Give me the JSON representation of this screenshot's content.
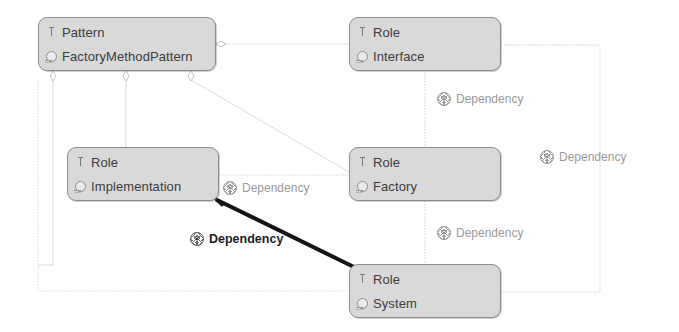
{
  "diagram": {
    "title": "FactoryMethodPattern",
    "background": "#ffffff",
    "node_fill": "#d9d9d9",
    "node_border": "#8d8d8d",
    "wire_color": "#c9c9c9",
    "selected_wire_color": "#141414",
    "label_color": "#9a9a9a",
    "selected_label_color": "#1d1d1d"
  },
  "nodes": [
    {
      "id": "pattern",
      "stereotype": "Pattern",
      "name": "FactoryMethodPattern",
      "icon_top": "stereotype-icon",
      "icon_bottom": "element-icon",
      "x": 38,
      "y": 17,
      "w": 178,
      "h": 54
    },
    {
      "id": "interface",
      "stereotype": "Role",
      "name": "Interface",
      "icon_top": "stereotype-icon",
      "icon_bottom": "element-icon",
      "x": 349,
      "y": 17,
      "w": 152,
      "h": 54
    },
    {
      "id": "implementation",
      "stereotype": "Role",
      "name": "Implementation",
      "icon_top": "stereotype-icon",
      "icon_bottom": "element-icon",
      "x": 67,
      "y": 147,
      "w": 152,
      "h": 54
    },
    {
      "id": "factory",
      "stereotype": "Role",
      "name": "Factory",
      "icon_top": "stereotype-icon",
      "icon_bottom": "element-icon",
      "x": 349,
      "y": 147,
      "w": 152,
      "h": 54
    },
    {
      "id": "system",
      "stereotype": "Role",
      "name": "System",
      "icon_top": "stereotype-icon",
      "icon_bottom": "element-icon",
      "x": 349,
      "y": 264,
      "w": 152,
      "h": 54
    }
  ],
  "edge_labels": [
    {
      "id": "dep-interface-factory",
      "text": "Dependency",
      "icon": "dependency-icon",
      "x": 437,
      "y": 92,
      "selected": false
    },
    {
      "id": "dep-interface-system",
      "text": "Dependency",
      "icon": "dependency-icon",
      "x": 540,
      "y": 150,
      "selected": false
    },
    {
      "id": "dep-implementation-factory",
      "text": "Dependency",
      "icon": "dependency-icon",
      "x": 223,
      "y": 181,
      "selected": false
    },
    {
      "id": "dep-factory-system",
      "text": "Dependency",
      "icon": "dependency-icon",
      "x": 437,
      "y": 226,
      "selected": false
    },
    {
      "id": "dep-implementation-system",
      "text": "Dependency",
      "icon": "dependency-icon",
      "x": 190,
      "y": 232,
      "selected": true
    }
  ],
  "edges": [
    {
      "id": "agg-pattern-interface",
      "kind": "aggregation",
      "from": "pattern",
      "to": "interface"
    },
    {
      "id": "agg-pattern-implementation",
      "kind": "aggregation",
      "from": "pattern",
      "to": "implementation"
    },
    {
      "id": "agg-pattern-factory",
      "kind": "aggregation",
      "from": "pattern",
      "to": "factory"
    },
    {
      "id": "agg-pattern-system",
      "kind": "aggregation",
      "from": "pattern",
      "to": "system"
    },
    {
      "id": "dep-interface-factory",
      "kind": "dependency",
      "from": "interface",
      "to": "factory"
    },
    {
      "id": "dep-interface-system",
      "kind": "dependency",
      "from": "interface",
      "to": "system"
    },
    {
      "id": "dep-implementation-factory",
      "kind": "dependency",
      "from": "implementation",
      "to": "factory"
    },
    {
      "id": "dep-factory-system",
      "kind": "dependency",
      "from": "factory",
      "to": "system"
    },
    {
      "id": "dep-implementation-system",
      "kind": "dependency-selected",
      "from": "implementation",
      "to": "system"
    }
  ]
}
